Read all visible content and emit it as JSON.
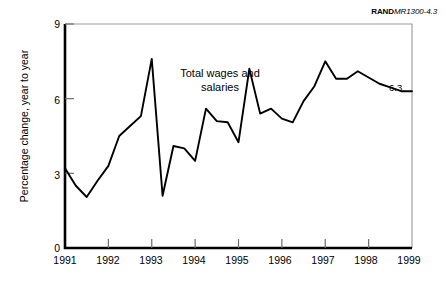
{
  "figure": {
    "source_id_bold": "RAND",
    "source_id_italic": "MR1300-4.3"
  },
  "chart_data": {
    "type": "line",
    "title": "",
    "xlabel": "",
    "ylabel": "Percentage change, year to year",
    "series_label": "Total wages and salaries",
    "end_point_label": "6.3",
    "line_color": "#000000",
    "grid": false,
    "legend_position": "inline-annotation",
    "xlim": [
      1991,
      1999
    ],
    "ylim": [
      0,
      9
    ],
    "ytick_labels": [
      "0",
      "3",
      "6",
      "9"
    ],
    "yticks": [
      0,
      3,
      6,
      9
    ],
    "xtick_labels": [
      "1991",
      "1992",
      "1993",
      "1994",
      "1995",
      "1996",
      "1997",
      "1998",
      "1999"
    ],
    "xticks": [
      1991,
      1992,
      1993,
      1994,
      1995,
      1996,
      1997,
      1998,
      1999
    ],
    "x": [
      1991.0,
      1991.25,
      1991.5,
      1991.75,
      1992.0,
      1992.25,
      1992.5,
      1992.75,
      1993.0,
      1993.25,
      1993.5,
      1993.75,
      1994.0,
      1994.25,
      1994.5,
      1994.75,
      1995.0,
      1995.25,
      1995.5,
      1995.75,
      1996.0,
      1996.25,
      1996.5,
      1996.75,
      1997.0,
      1997.25,
      1997.5,
      1997.75,
      1998.0,
      1998.25,
      1998.5,
      1998.75,
      1999.0
    ],
    "values": [
      3.2,
      2.5,
      2.05,
      2.7,
      3.3,
      4.5,
      4.9,
      5.3,
      7.6,
      2.1,
      4.1,
      4.0,
      3.5,
      5.6,
      5.1,
      5.05,
      4.25,
      7.2,
      5.4,
      5.6,
      5.2,
      5.05,
      5.9,
      6.5,
      7.5,
      6.8,
      6.8,
      7.1,
      6.85,
      6.6,
      6.45,
      6.3,
      6.3
    ]
  }
}
